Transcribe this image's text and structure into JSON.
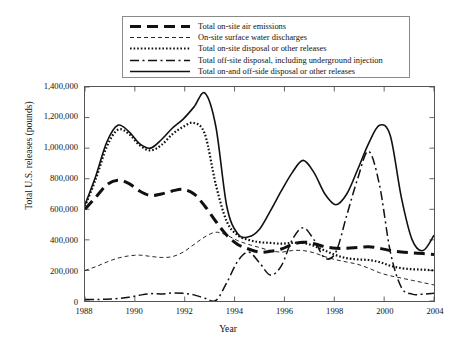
{
  "chart_data": {
    "type": "line",
    "title": "",
    "xlabel": "Year",
    "ylabel": "Total U.S. releases (pounds)",
    "xlim": [
      1988,
      2004
    ],
    "ylim": [
      0,
      1400000
    ],
    "xticks": [
      1988,
      1990,
      1992,
      1994,
      1996,
      1998,
      2000,
      2004
    ],
    "xtick_labels": [
      "1988",
      "1990",
      "1992",
      "1994",
      "1996",
      "1998",
      "2000",
      "2004"
    ],
    "yticks": [
      0,
      200000,
      400000,
      600000,
      800000,
      1000000,
      1200000,
      1400000
    ],
    "ytick_labels": [
      "0",
      "200,000",
      "400,000",
      "600,000",
      "800,000",
      "1,000,000",
      "1,200,000",
      "1,400,000"
    ],
    "grid": false,
    "legend_position": "top-center",
    "x": [
      1988,
      1988.5,
      1989,
      1989.5,
      1990,
      1990.5,
      1991,
      1991.5,
      1992,
      1992.5,
      1993,
      1993.5,
      1994,
      1994.5,
      1995,
      1995.5,
      1996,
      1996.5,
      1997,
      1997.5,
      1998,
      1998.5,
      1999,
      1999.5,
      2000,
      2000.5,
      2001,
      2001.5,
      2002,
      2002.5,
      2003,
      2003.5,
      2004
    ],
    "series": [
      {
        "name": "Total on-site air emissions",
        "style": "thick-dashed",
        "values": [
          600000,
          680000,
          760000,
          790000,
          770000,
          720000,
          690000,
          700000,
          720000,
          730000,
          700000,
          620000,
          520000,
          430000,
          370000,
          340000,
          320000,
          325000,
          340000,
          370000,
          385000,
          375000,
          355000,
          345000,
          345000,
          350000,
          355000,
          345000,
          330000,
          320000,
          315000,
          310000,
          305000
        ]
      },
      {
        "name": "On-site surface water discharges",
        "style": "thin-dashed",
        "values": [
          200000,
          225000,
          255000,
          280000,
          295000,
          300000,
          292000,
          285000,
          290000,
          320000,
          370000,
          420000,
          450000,
          430000,
          395000,
          370000,
          350000,
          330000,
          320000,
          330000,
          330000,
          315000,
          290000,
          270000,
          255000,
          240000,
          215000,
          185000,
          165000,
          150000,
          135000,
          120000,
          105000
        ]
      },
      {
        "name": "Total on-site disposal or other releases",
        "style": "thin-dotted",
        "values": [
          620000,
          800000,
          1010000,
          1120000,
          1095000,
          1020000,
          985000,
          1020000,
          1090000,
          1140000,
          1165000,
          1090000,
          760000,
          520000,
          430000,
          400000,
          385000,
          380000,
          375000,
          380000,
          380000,
          360000,
          330000,
          300000,
          280000,
          272000,
          268000,
          255000,
          230000,
          215000,
          208000,
          205000,
          200000
        ]
      },
      {
        "name": "Total off-site disposal, including underground injection",
        "style": "dash-dot",
        "values": [
          10000,
          10000,
          12000,
          16000,
          24000,
          38000,
          48000,
          46000,
          52000,
          50000,
          40000,
          18000,
          4000,
          120000,
          260000,
          320000,
          250000,
          170000,
          230000,
          400000,
          480000,
          400000,
          280000,
          320000,
          560000,
          800000,
          980000,
          760000,
          320000,
          90000,
          45000,
          45000,
          50000
        ]
      },
      {
        "name": "Total on-and off-side disposal or other releases",
        "style": "thick-solid",
        "values": [
          630000,
          820000,
          1040000,
          1150000,
          1110000,
          1030000,
          1000000,
          1055000,
          1130000,
          1190000,
          1270000,
          1360000,
          1140000,
          620000,
          440000,
          420000,
          470000,
          590000,
          720000,
          840000,
          920000,
          840000,
          700000,
          630000,
          700000,
          860000,
          1030000,
          1150000,
          1080000,
          680000,
          400000,
          330000,
          430000
        ]
      }
    ]
  },
  "legend": {
    "items": [
      {
        "label": "Total on-site air emissions",
        "style": "thick-dashed"
      },
      {
        "label": "On-site surface water discharges",
        "style": "thin-dashed"
      },
      {
        "label": "Total on-site disposal or other releases",
        "style": "thin-dotted"
      },
      {
        "label": "Total off-site disposal, including underground injection",
        "style": "dash-dot"
      },
      {
        "label": "Total on-and off-side disposal or other releases",
        "style": "thick-solid"
      }
    ]
  },
  "colors": {
    "ink": "#111111",
    "frame": "#555555",
    "background": "#ffffff"
  }
}
